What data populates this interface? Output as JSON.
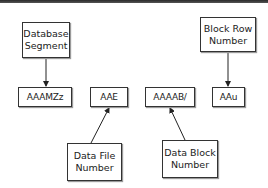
{
  "diagram": {
    "top_labels": [
      {
        "id": "database-segment",
        "lines": [
          "Database",
          "Segment"
        ]
      },
      {
        "id": "block-row-number",
        "lines": [
          "Block Row",
          "Number"
        ]
      }
    ],
    "rowid_parts": [
      {
        "id": "segment-part",
        "value": "AAAMZz"
      },
      {
        "id": "file-part",
        "value": "AAE"
      },
      {
        "id": "block-part",
        "value": "AAAAB/"
      },
      {
        "id": "row-part",
        "value": "AAu"
      }
    ],
    "bottom_labels": [
      {
        "id": "data-file-number",
        "lines": [
          "Data File",
          "Number"
        ]
      },
      {
        "id": "data-block-number",
        "lines": [
          "Data Block",
          "Number"
        ]
      }
    ],
    "connections": [
      {
        "from": "Database Segment",
        "to": "AAAMZz"
      },
      {
        "from": "Block Row Number",
        "to": "AAu"
      },
      {
        "from": "Data File Number",
        "to": "AAE"
      },
      {
        "from": "Data Block Number",
        "to": "AAAAB/"
      }
    ],
    "colors": {
      "line": "#222222",
      "border": "#333333",
      "top_bar": "#2a2a2a"
    }
  }
}
